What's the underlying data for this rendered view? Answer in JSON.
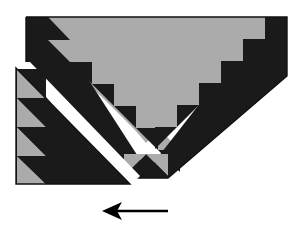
{
  "figure": {
    "canvas": {
      "width": 302,
      "height": 239,
      "background": "#FFFFFF"
    },
    "colors": {
      "light": "#ABABAB",
      "dark": "#1A1A1A",
      "background": "#FFFFFF",
      "outline": "#1A1A1A"
    },
    "pieces": [
      {
        "name": "main-chevron",
        "description": "Large V-shaped gray body with dark sawtooth borders",
        "top_left_x": 26,
        "top_right_x": 287,
        "top_y": 17,
        "apex_x": 146,
        "apex_y": 176
      },
      {
        "name": "detached-corner-piece",
        "description": "Separate lower-left right triangle with gray sawtooth column",
        "left_x": 16,
        "top_y": 68,
        "bottom_y": 185,
        "right_x": 130
      }
    ],
    "left_band_teeth": 6,
    "right_band_teeth": 6,
    "left_column_teeth": 4
  },
  "arrow": {
    "name": "direction-arrow",
    "label": "",
    "direction": "left",
    "tail_x": 168,
    "head_x": 104,
    "y": 211,
    "color": "#000000"
  }
}
